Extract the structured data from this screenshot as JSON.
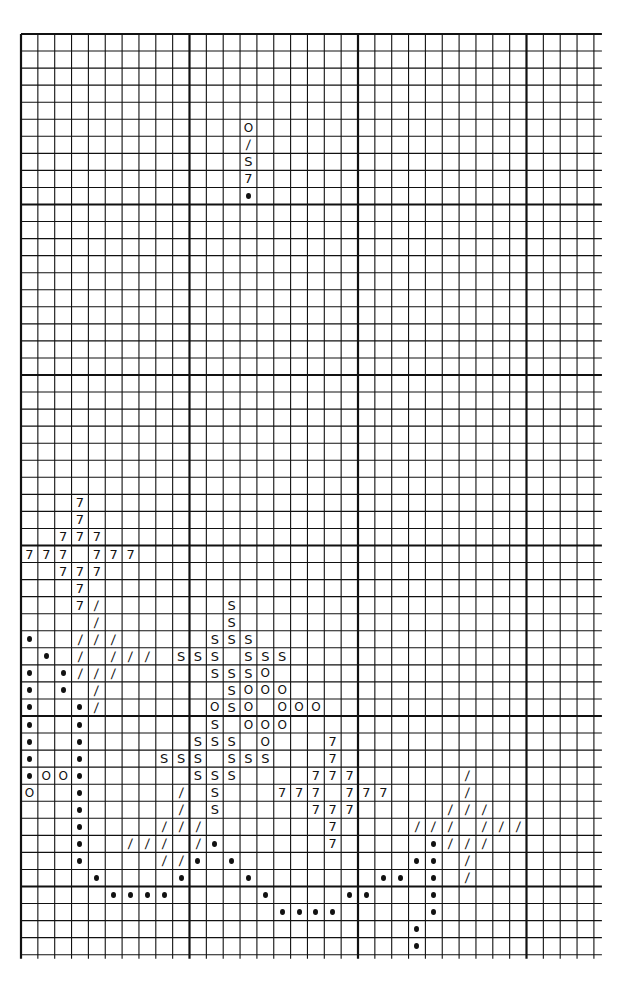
{
  "chart": {
    "type": "cross-stitch-pattern",
    "columns": 34,
    "rows": 54,
    "cell_width": 16.85,
    "cell_height": 17.05,
    "heavy_line_every": 10,
    "grid_color": "#111111",
    "background": "#ffffff"
  },
  "key": [
    {
      "symbol": "O",
      "id": "O"
    },
    {
      "symbol": "/",
      "id": "slash"
    },
    {
      "symbol": "S",
      "id": "S"
    },
    {
      "symbol": "7",
      "id": "7"
    },
    {
      "symbol": "•",
      "id": "dot"
    }
  ],
  "cells": [
    [
      5,
      13,
      "O"
    ],
    [
      6,
      13,
      "/"
    ],
    [
      7,
      13,
      "S"
    ],
    [
      8,
      13,
      "7"
    ],
    [
      9,
      13,
      "•"
    ],
    [
      27,
      3,
      "7"
    ],
    [
      28,
      3,
      "7"
    ],
    [
      29,
      2,
      "7"
    ],
    [
      29,
      3,
      "7"
    ],
    [
      29,
      4,
      "7"
    ],
    [
      30,
      0,
      "7"
    ],
    [
      30,
      1,
      "7"
    ],
    [
      30,
      2,
      "7"
    ],
    [
      30,
      4,
      "7"
    ],
    [
      30,
      5,
      "7"
    ],
    [
      30,
      6,
      "7"
    ],
    [
      31,
      2,
      "7"
    ],
    [
      31,
      3,
      "7"
    ],
    [
      31,
      4,
      "7"
    ],
    [
      32,
      3,
      "7"
    ],
    [
      33,
      3,
      "7"
    ],
    [
      33,
      4,
      "/"
    ],
    [
      33,
      12,
      "S"
    ],
    [
      34,
      4,
      "/"
    ],
    [
      34,
      12,
      "S"
    ],
    [
      35,
      0,
      "•"
    ],
    [
      35,
      3,
      "/"
    ],
    [
      35,
      4,
      "/"
    ],
    [
      35,
      5,
      "/"
    ],
    [
      35,
      11,
      "S"
    ],
    [
      35,
      12,
      "S"
    ],
    [
      35,
      13,
      "S"
    ],
    [
      36,
      1,
      "•"
    ],
    [
      36,
      3,
      "/"
    ],
    [
      36,
      5,
      "/"
    ],
    [
      36,
      6,
      "/"
    ],
    [
      36,
      7,
      "/"
    ],
    [
      36,
      9,
      "S"
    ],
    [
      36,
      10,
      "S"
    ],
    [
      36,
      11,
      "S"
    ],
    [
      36,
      13,
      "S"
    ],
    [
      36,
      14,
      "S"
    ],
    [
      36,
      15,
      "S"
    ],
    [
      37,
      0,
      "•"
    ],
    [
      37,
      2,
      "•"
    ],
    [
      37,
      3,
      "/"
    ],
    [
      37,
      4,
      "/"
    ],
    [
      37,
      5,
      "/"
    ],
    [
      37,
      11,
      "S"
    ],
    [
      37,
      12,
      "S"
    ],
    [
      37,
      13,
      "S"
    ],
    [
      37,
      14,
      "O"
    ],
    [
      38,
      0,
      "•"
    ],
    [
      38,
      2,
      "•"
    ],
    [
      38,
      4,
      "/"
    ],
    [
      38,
      12,
      "S"
    ],
    [
      38,
      13,
      "O"
    ],
    [
      38,
      14,
      "O"
    ],
    [
      38,
      15,
      "O"
    ],
    [
      39,
      0,
      "•"
    ],
    [
      39,
      3,
      "•"
    ],
    [
      39,
      4,
      "/"
    ],
    [
      39,
      11,
      "O"
    ],
    [
      39,
      12,
      "S"
    ],
    [
      39,
      13,
      "O"
    ],
    [
      39,
      15,
      "O"
    ],
    [
      39,
      16,
      "O"
    ],
    [
      39,
      17,
      "O"
    ],
    [
      40,
      0,
      "•"
    ],
    [
      40,
      3,
      "•"
    ],
    [
      40,
      11,
      "S"
    ],
    [
      40,
      13,
      "O"
    ],
    [
      40,
      14,
      "O"
    ],
    [
      40,
      15,
      "O"
    ],
    [
      41,
      0,
      "•"
    ],
    [
      41,
      3,
      "•"
    ],
    [
      41,
      10,
      "S"
    ],
    [
      41,
      11,
      "S"
    ],
    [
      41,
      12,
      "S"
    ],
    [
      41,
      14,
      "O"
    ],
    [
      41,
      18,
      "7"
    ],
    [
      42,
      0,
      "•"
    ],
    [
      42,
      3,
      "•"
    ],
    [
      42,
      8,
      "S"
    ],
    [
      42,
      9,
      "S"
    ],
    [
      42,
      10,
      "S"
    ],
    [
      42,
      12,
      "S"
    ],
    [
      42,
      13,
      "S"
    ],
    [
      42,
      14,
      "S"
    ],
    [
      42,
      18,
      "7"
    ],
    [
      43,
      0,
      "•"
    ],
    [
      43,
      1,
      "O"
    ],
    [
      43,
      2,
      "O"
    ],
    [
      43,
      3,
      "•"
    ],
    [
      43,
      10,
      "S"
    ],
    [
      43,
      11,
      "S"
    ],
    [
      43,
      12,
      "S"
    ],
    [
      43,
      17,
      "7"
    ],
    [
      43,
      18,
      "7"
    ],
    [
      43,
      19,
      "7"
    ],
    [
      43,
      26,
      "/"
    ],
    [
      44,
      0,
      "O"
    ],
    [
      44,
      3,
      "•"
    ],
    [
      44,
      9,
      "/"
    ],
    [
      44,
      11,
      "S"
    ],
    [
      44,
      15,
      "7"
    ],
    [
      44,
      16,
      "7"
    ],
    [
      44,
      17,
      "7"
    ],
    [
      44,
      19,
      "7"
    ],
    [
      44,
      20,
      "7"
    ],
    [
      44,
      21,
      "7"
    ],
    [
      44,
      26,
      "/"
    ],
    [
      45,
      3,
      "•"
    ],
    [
      45,
      9,
      "/"
    ],
    [
      45,
      11,
      "S"
    ],
    [
      45,
      17,
      "7"
    ],
    [
      45,
      18,
      "7"
    ],
    [
      45,
      19,
      "7"
    ],
    [
      45,
      25,
      "/"
    ],
    [
      45,
      26,
      "/"
    ],
    [
      45,
      27,
      "/"
    ],
    [
      46,
      3,
      "•"
    ],
    [
      46,
      8,
      "/"
    ],
    [
      46,
      9,
      "/"
    ],
    [
      46,
      10,
      "/"
    ],
    [
      46,
      18,
      "7"
    ],
    [
      46,
      23,
      "/"
    ],
    [
      46,
      24,
      "/"
    ],
    [
      46,
      25,
      "/"
    ],
    [
      46,
      27,
      "/"
    ],
    [
      46,
      28,
      "/"
    ],
    [
      46,
      29,
      "/"
    ],
    [
      47,
      3,
      "•"
    ],
    [
      47,
      6,
      "/"
    ],
    [
      47,
      7,
      "/"
    ],
    [
      47,
      8,
      "/"
    ],
    [
      47,
      10,
      "/"
    ],
    [
      47,
      11,
      "•"
    ],
    [
      47,
      18,
      "7"
    ],
    [
      47,
      24,
      "•"
    ],
    [
      47,
      25,
      "/"
    ],
    [
      47,
      26,
      "/"
    ],
    [
      47,
      27,
      "/"
    ],
    [
      48,
      3,
      "•"
    ],
    [
      48,
      8,
      "/"
    ],
    [
      48,
      9,
      "/"
    ],
    [
      48,
      10,
      "•"
    ],
    [
      48,
      12,
      "•"
    ],
    [
      48,
      23,
      "•"
    ],
    [
      48,
      24,
      "•"
    ],
    [
      48,
      26,
      "/"
    ],
    [
      49,
      4,
      "•"
    ],
    [
      49,
      9,
      "•"
    ],
    [
      49,
      13,
      "•"
    ],
    [
      49,
      21,
      "•"
    ],
    [
      49,
      22,
      "•"
    ],
    [
      49,
      24,
      "•"
    ],
    [
      49,
      26,
      "/"
    ],
    [
      50,
      5,
      "•"
    ],
    [
      50,
      6,
      "•"
    ],
    [
      50,
      7,
      "•"
    ],
    [
      50,
      8,
      "•"
    ],
    [
      50,
      14,
      "•"
    ],
    [
      50,
      19,
      "•"
    ],
    [
      50,
      20,
      "•"
    ],
    [
      50,
      24,
      "•"
    ],
    [
      51,
      15,
      "•"
    ],
    [
      51,
      16,
      "•"
    ],
    [
      51,
      17,
      "•"
    ],
    [
      51,
      18,
      "•"
    ],
    [
      51,
      24,
      "•"
    ],
    [
      52,
      23,
      "•"
    ],
    [
      53,
      23,
      "•"
    ]
  ]
}
